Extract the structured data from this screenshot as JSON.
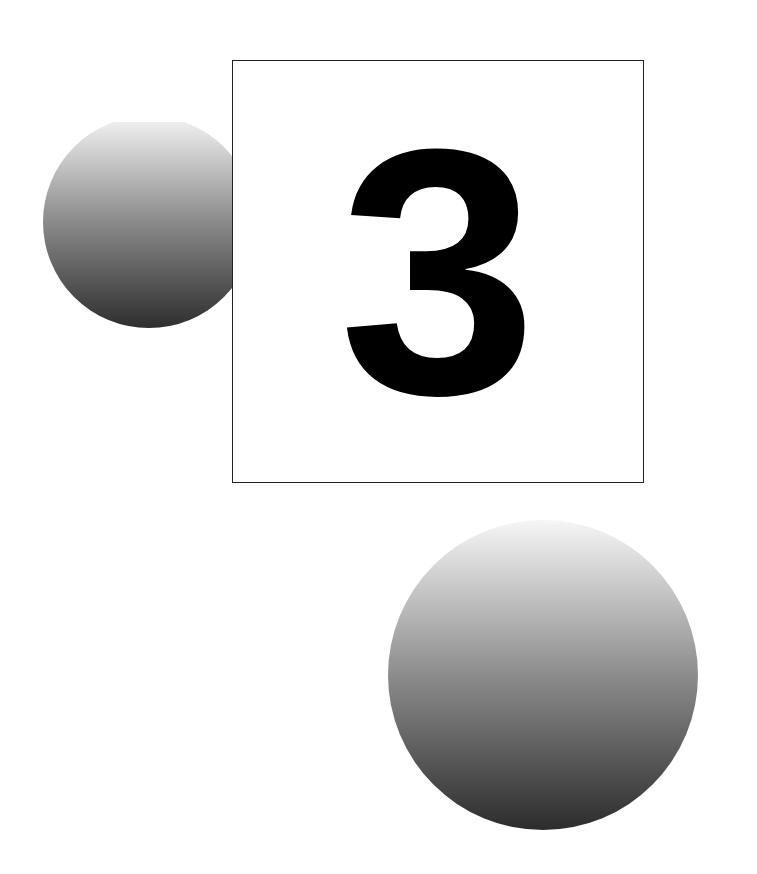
{
  "illustration": {
    "numeral": "3",
    "colors": {
      "background": "#ffffff",
      "frame": "#222222",
      "numeral": "#000000",
      "sphere_top": "#f4f4f4",
      "sphere_mid": "#8a8a8a",
      "sphere_bottom": "#2e2e2e"
    }
  }
}
